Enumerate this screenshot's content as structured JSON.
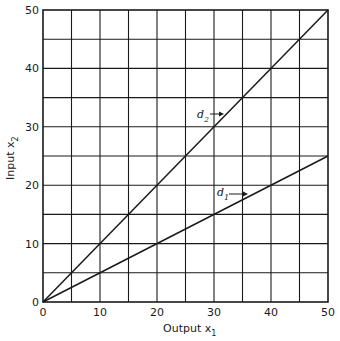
{
  "chart_data": {
    "type": "line",
    "title": "",
    "xlabel": "Output x1",
    "ylabel": "Input x2",
    "xlabel_main": "Output x",
    "xlabel_sub": "1",
    "ylabel_main": "Input x",
    "ylabel_sub": "2",
    "xlim": [
      0,
      50
    ],
    "ylim": [
      0,
      50
    ],
    "grid": true,
    "grid_step": 5,
    "x_ticks": [
      0,
      10,
      20,
      30,
      40,
      50
    ],
    "y_ticks": [
      0,
      10,
      20,
      30,
      40,
      50
    ],
    "x_tick_labels": [
      "0",
      "10",
      "20",
      "30",
      "40",
      "50"
    ],
    "y_tick_labels": [
      "0",
      "10",
      "20",
      "30",
      "40",
      "50"
    ],
    "legend_position": "none",
    "series": [
      {
        "name": "d2",
        "label_main": "d",
        "label_sub": "2",
        "x": [
          0,
          50
        ],
        "y": [
          0,
          50
        ],
        "slope": 1.0
      },
      {
        "name": "d1",
        "label_main": "d",
        "label_sub": "1",
        "x": [
          0,
          50
        ],
        "y": [
          0,
          25
        ],
        "slope": 0.5
      }
    ],
    "annotations": [
      {
        "text": "d2",
        "points_to": "d2 line near x≈31, y≈31"
      },
      {
        "text": "d1",
        "points_to": "d1 line near x≈35, y≈17.5"
      }
    ]
  },
  "colors": {
    "line": "#1a1a1a",
    "grid": "#1a1a1a",
    "background": "#ffffff"
  }
}
